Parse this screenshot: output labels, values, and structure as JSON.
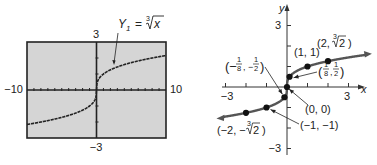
{
  "chart_data": [
    {
      "type": "line",
      "panel": "calculator-screen",
      "title": "",
      "function": "Y1 = cube root of x",
      "label": {
        "prefix": "Y",
        "subscript": "1",
        "equals": "=",
        "index": "3",
        "radicand": "x"
      },
      "xlim": [
        -10,
        10
      ],
      "ylim": [
        -3,
        3
      ],
      "xscale": 1,
      "yscale": 1,
      "tick_labels": {
        "xmin": "−10",
        "xmax": "10",
        "ymax": "3",
        "ymin": "−3"
      },
      "grid": false,
      "background": "#d5d5d5",
      "curve_color": "#222222",
      "frame_color": "#222222",
      "x": [
        -10,
        -8,
        -6,
        -4,
        -2,
        -1,
        -0.5,
        -0.125,
        0,
        0.125,
        0.5,
        1,
        2,
        4,
        6,
        8,
        10
      ],
      "y": [
        -2.154,
        -2,
        -1.817,
        -1.587,
        -1.26,
        -1,
        -0.794,
        -0.5,
        0,
        0.5,
        0.794,
        1,
        1.26,
        1.587,
        1.817,
        2,
        2.154
      ]
    },
    {
      "type": "line",
      "panel": "hand-drawn-graph",
      "title": "",
      "function": "y = cube root of x",
      "xlabel": "x",
      "ylabel": "y",
      "xlim": [
        -3,
        3
      ],
      "ylim": [
        -3,
        3
      ],
      "tick_labels": {
        "xmin": "−3",
        "xmax": "3",
        "ymax": "3",
        "ymin": "−3"
      },
      "grid": false,
      "curve_color": "#555555",
      "point_color": "#111111",
      "curve_x_range": [
        -3.1,
        3.8
      ],
      "points": [
        {
          "x": -2,
          "y": -1.26,
          "label": "(−2, −∛2)",
          "label_parts": {
            "open": "(−2, −",
            "index": "3",
            "radicand": "2",
            "close": ")"
          }
        },
        {
          "x": -1,
          "y": -1,
          "label": "(−1, −1)"
        },
        {
          "x": -0.125,
          "y": -0.5,
          "label": "(−1/8, −1/2)",
          "label_parts": {
            "open": "(−",
            "n1": "1",
            "d1": "8",
            "sep": ", −",
            "n2": "1",
            "d2": "2",
            "close": ")"
          }
        },
        {
          "x": 0,
          "y": 0,
          "label": "(0, 0)"
        },
        {
          "x": 0.125,
          "y": 0.5,
          "label": "(1/8, 1/2)",
          "label_parts": {
            "open": "(",
            "n1": "1",
            "d1": "8",
            "sep": ",",
            "n2": "1",
            "d2": "2",
            "close": ")"
          }
        },
        {
          "x": 1,
          "y": 1,
          "label": "(1, 1)"
        },
        {
          "x": 2,
          "y": 1.26,
          "label": "(2, ∛2)",
          "label_parts": {
            "open": "(2, ",
            "index": "3",
            "radicand": "2",
            "close": ")"
          }
        }
      ]
    }
  ]
}
